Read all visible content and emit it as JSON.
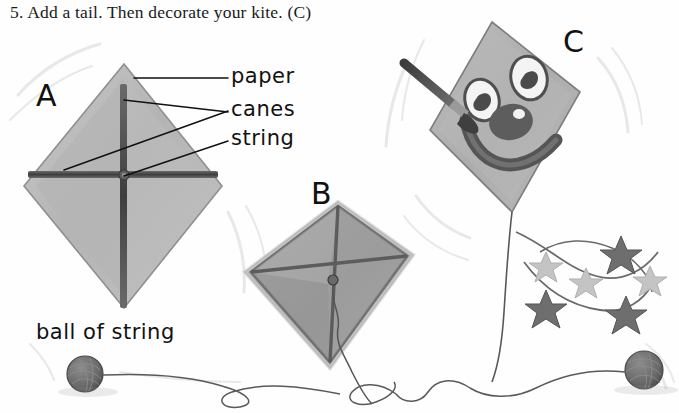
{
  "page": {
    "background_color": "#fefefe",
    "ink_color": "#1a1a1a",
    "width": 679,
    "height": 413
  },
  "instruction": {
    "step_number": "5.",
    "text": "5. Add a tail. Then decorate your kite. (C)"
  },
  "labels": {
    "paper": "paper",
    "canes": "canes",
    "string": "string",
    "ball_of_string": "ball of string"
  },
  "figure_letters": {
    "a": "A",
    "b": "B",
    "c": "C"
  },
  "illustration": {
    "title": "Three stages of making a kite",
    "kite_a": {
      "letter": "A",
      "description": "Diamond kite with crossed canes and centre string knot",
      "paper_color": "#b9b9b9",
      "cane_color": "#555555",
      "callouts": [
        "paper",
        "canes",
        "string"
      ]
    },
    "kite_b": {
      "letter": "B",
      "description": "Square kite tilted, diagonal canes, string hanging from centre",
      "paper_color": "#a6a6a6",
      "frame_color": "#6f6f6f"
    },
    "kite_c": {
      "letter": "C",
      "description": "Square kite decorated with a smiling face, being painted with a brush, with a starry tail",
      "paper_color": "#b3b3b3",
      "face_color": "#5a5a5a",
      "brush_handle_color": "#4a4a4a",
      "tail_star_count": 6
    },
    "ball_of_string_left": {
      "label": "ball of string",
      "color": "#6e6e6e"
    },
    "ball_of_string_right": {
      "label": "ball of string",
      "color": "#6e6e6e"
    }
  }
}
